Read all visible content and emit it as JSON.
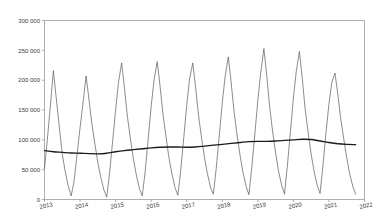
{
  "chart_data": {
    "type": "line",
    "title": "",
    "subtitle": "",
    "xlabel": "",
    "ylabel": "",
    "ylim": [
      0,
      300000
    ],
    "xlim": [
      2013.0,
      2022.0
    ],
    "grid": false,
    "legend_position": "none",
    "y_ticks": [
      0,
      50000,
      100000,
      150000,
      200000,
      250000,
      300000
    ],
    "y_tick_labels": [
      "0",
      "50 000",
      "100 000",
      "150 000",
      "200 000",
      "250 000",
      "300 000"
    ],
    "x_ticks": [
      2013,
      2014,
      2015,
      2016,
      2017,
      2018,
      2019,
      2020,
      2021,
      2022
    ],
    "x_tick_labels": [
      "2013",
      "2014",
      "2015",
      "2016",
      "2017",
      "2018",
      "2019",
      "2020",
      "2021",
      "2022"
    ],
    "series": [
      {
        "name": "seasonal",
        "color": "#5a5a5a",
        "x": [
          2013.0,
          2013.08,
          2013.17,
          2013.25,
          2013.33,
          2013.42,
          2013.5,
          2013.58,
          2013.67,
          2013.75,
          2013.83,
          2013.92,
          2014.0,
          2014.08,
          2014.17,
          2014.25,
          2014.33,
          2014.42,
          2014.5,
          2014.58,
          2014.67,
          2014.75,
          2014.83,
          2014.92,
          2015.0,
          2015.08,
          2015.17,
          2015.25,
          2015.33,
          2015.42,
          2015.5,
          2015.58,
          2015.67,
          2015.75,
          2015.83,
          2015.92,
          2016.0,
          2016.08,
          2016.17,
          2016.25,
          2016.33,
          2016.42,
          2016.5,
          2016.58,
          2016.67,
          2016.75,
          2016.83,
          2016.92,
          2017.0,
          2017.08,
          2017.17,
          2017.25,
          2017.33,
          2017.42,
          2017.5,
          2017.58,
          2017.67,
          2017.75,
          2017.83,
          2017.92,
          2018.0,
          2018.08,
          2018.17,
          2018.25,
          2018.33,
          2018.42,
          2018.5,
          2018.58,
          2018.67,
          2018.75,
          2018.83,
          2018.92,
          2019.0,
          2019.08,
          2019.17,
          2019.25,
          2019.33,
          2019.42,
          2019.5,
          2019.58,
          2019.67,
          2019.75,
          2019.83,
          2019.92,
          2020.0,
          2020.08,
          2020.17,
          2020.25,
          2020.33,
          2020.42,
          2020.5,
          2020.58,
          2020.67,
          2020.75,
          2020.83,
          2020.92,
          2021.0,
          2021.08,
          2021.17,
          2021.25,
          2021.33,
          2021.42,
          2021.5,
          2021.58,
          2021.67,
          2021.75
        ],
        "values": [
          52000,
          100000,
          160000,
          216000,
          170000,
          120000,
          76000,
          48000,
          22000,
          6000,
          30000,
          78000,
          120000,
          160000,
          207000,
          168000,
          128000,
          92000,
          62000,
          38000,
          16000,
          4000,
          44000,
          100000,
          150000,
          196000,
          229000,
          186000,
          140000,
          100000,
          68000,
          42000,
          18000,
          6000,
          46000,
          104000,
          156000,
          200000,
          231000,
          190000,
          144000,
          104000,
          70000,
          44000,
          20000,
          7000,
          48000,
          106000,
          158000,
          202000,
          229000,
          188000,
          142000,
          102000,
          70000,
          44000,
          20000,
          9000,
          52000,
          110000,
          162000,
          206000,
          239000,
          196000,
          148000,
          106000,
          74000,
          46000,
          22000,
          8000,
          54000,
          112000,
          166000,
          212000,
          253000,
          208000,
          156000,
          112000,
          78000,
          48000,
          24000,
          9000,
          56000,
          116000,
          170000,
          214000,
          248000,
          203000,
          152000,
          110000,
          76000,
          48000,
          24000,
          10000,
          56000,
          114000,
          160000,
          196000,
          212000,
          176000,
          136000,
          100000,
          70000,
          44000,
          22000,
          9000
        ]
      },
      {
        "name": "trend",
        "color": "#1c1c1c",
        "x": [
          2013.0,
          2013.25,
          2013.5,
          2013.75,
          2014.0,
          2014.25,
          2014.5,
          2014.75,
          2015.0,
          2015.25,
          2015.5,
          2015.75,
          2016.0,
          2016.25,
          2016.5,
          2016.75,
          2017.0,
          2017.25,
          2017.5,
          2017.75,
          2018.0,
          2018.25,
          2018.5,
          2018.75,
          2019.0,
          2019.25,
          2019.5,
          2019.75,
          2020.0,
          2020.25,
          2020.5,
          2020.75,
          2021.0,
          2021.25,
          2021.5,
          2021.75
        ],
        "values": [
          82000,
          80000,
          79000,
          78000,
          77500,
          77000,
          76500,
          77500,
          80000,
          82000,
          83500,
          85000,
          86500,
          87500,
          88000,
          88000,
          87500,
          88000,
          89500,
          91000,
          92500,
          94000,
          95500,
          97000,
          97500,
          97500,
          98000,
          99000,
          100000,
          101000,
          100500,
          98000,
          95500,
          93500,
          92500,
          92000
        ]
      }
    ]
  }
}
